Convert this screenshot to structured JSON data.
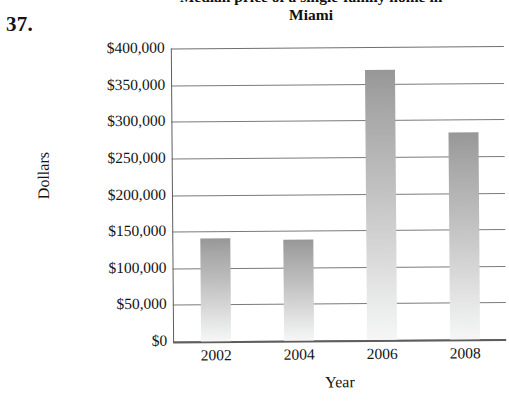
{
  "problem": {
    "number": "37."
  },
  "chart_data": {
    "type": "bar",
    "title": "Median price of a single-family home in Miami",
    "title_line1": "Median price of a single-family home in",
    "title_line2": "Miami",
    "xlabel": "Year",
    "ylabel": "Dollars",
    "categories": [
      "2002",
      "2004",
      "2006",
      "2008"
    ],
    "values": [
      140000,
      138000,
      368000,
      283000
    ],
    "ylim": [
      0,
      400000
    ],
    "ytick_values": [
      400000,
      350000,
      300000,
      250000,
      200000,
      150000,
      100000,
      50000,
      0
    ],
    "ytick_labels": [
      "$400,000",
      "$350,000",
      "$300,000",
      "$250,000",
      "$200,000",
      "$150,000",
      "$100,000",
      "$50,000",
      "$0"
    ],
    "grid": true,
    "legend": null,
    "bar_color_top": "#979797",
    "bar_color_bottom": "#f5f6f5",
    "axis_color": "#5e5e5e",
    "gridline_color": "#7b7b7b"
  }
}
